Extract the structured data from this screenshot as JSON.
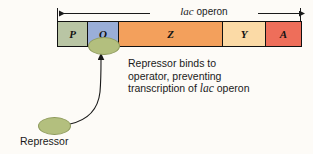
{
  "figure": {
    "background_color": "#fdfbf7",
    "operon_span": {
      "label_prefix": "lac",
      "label_suffix": " operon"
    },
    "genes": [
      {
        "symbol": "P",
        "name": "promoter",
        "color": "#b9c5a4",
        "width": 30
      },
      {
        "symbol": "O",
        "name": "operator",
        "color": "#9aaed8",
        "width": 31
      },
      {
        "symbol": "Z",
        "name": "lacZ",
        "color": "#f3a05c",
        "width": 104
      },
      {
        "symbol": "Y",
        "name": "lacY",
        "color": "#fbdaa6",
        "width": 43
      },
      {
        "symbol": "A",
        "name": "lacA",
        "color": "#ee6e5a",
        "width": 35
      }
    ],
    "annotation": {
      "line1": "Repressor binds to",
      "line2": "operator, preventing",
      "line3_prefix": "transcription of ",
      "line3_italic": "lac",
      "line3_suffix": " operon"
    },
    "repressor": {
      "caption": "Repressor",
      "color": "#b3bf7e",
      "outline": "#8e9a5c"
    },
    "colors": {
      "text": "#1a1a1a",
      "stroke": "#111111"
    }
  }
}
